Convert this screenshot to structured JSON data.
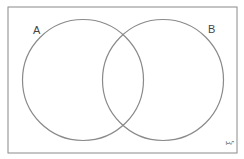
{
  "diagram": {
    "type": "venn",
    "universal_set_symbol": "ξ",
    "sets": [
      {
        "label": "A"
      },
      {
        "label": "B"
      }
    ],
    "colors": {
      "border": "#8a8a8a",
      "circle": "#8a8a8a",
      "text": "#444444",
      "background": "#ffffff"
    }
  }
}
